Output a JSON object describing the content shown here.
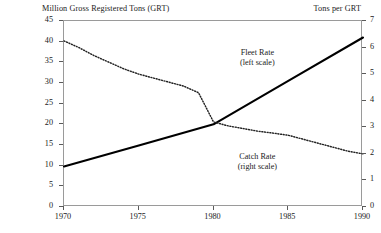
{
  "chart_data": {
    "type": "line",
    "title": "",
    "left_axis_title": "Million Gross Registered Tons (GRT)",
    "right_axis_title": "Tons per GRT",
    "xlabel": "",
    "x_ticks": [
      "1970",
      "1975",
      "1980",
      "1985",
      "1990"
    ],
    "x_tick_values": [
      1970,
      1975,
      1980,
      1985,
      1990
    ],
    "xlim": [
      1970,
      1990
    ],
    "left_ylabel": "Million Gross Registered Tons (GRT)",
    "left_ticks": [
      "0",
      "5",
      "10",
      "15",
      "20",
      "25",
      "30",
      "35",
      "40",
      "45"
    ],
    "left_tick_values": [
      0,
      5,
      10,
      15,
      20,
      25,
      30,
      35,
      40,
      45
    ],
    "ylim": [
      0,
      45
    ],
    "right_ylabel": "Tons per GRT",
    "right_ticks": [
      "0",
      "1",
      "2",
      "3",
      "4",
      "5",
      "6",
      "7"
    ],
    "right_tick_values": [
      0,
      1,
      2,
      3,
      4,
      5,
      6,
      7
    ],
    "right_ylim": [
      0,
      7
    ],
    "grid": false,
    "legend_position": "inline-annotations",
    "series": [
      {
        "name": "Fleet Rate",
        "axis": "left",
        "style": "solid",
        "color": "#000000",
        "annotation": [
          "Fleet Rate",
          "(left scale)"
        ],
        "x": [
          1970,
          1975,
          1980,
          1985,
          1990
        ],
        "values": [
          9.8,
          14.9,
          20.0,
          30.5,
          41.0
        ]
      },
      {
        "name": "Catch Rate",
        "axis": "right",
        "style": "dotted",
        "color": "#222222",
        "annotation": [
          "Catch Rate",
          "(right scale)"
        ],
        "x": [
          1970,
          1971,
          1972,
          1973,
          1974,
          1975,
          1976,
          1977,
          1978,
          1979,
          1980,
          1981,
          1982,
          1983,
          1984,
          1985,
          1986,
          1987,
          1988,
          1989,
          1990
        ],
        "values": [
          6.25,
          6.0,
          5.7,
          5.45,
          5.2,
          5.0,
          4.85,
          4.7,
          4.55,
          4.3,
          3.2,
          3.05,
          2.95,
          2.85,
          2.78,
          2.7,
          2.55,
          2.4,
          2.25,
          2.1,
          2.0
        ]
      }
    ],
    "annotations": [
      {
        "name": "fleet-rate-annotation",
        "lines": [
          "Fleet Rate",
          "(left scale)"
        ],
        "x": 1983.0,
        "y_px": 48
      },
      {
        "name": "catch-rate-annotation",
        "lines": [
          "Catch Rate",
          "(right scale)"
        ],
        "x": 1983.0,
        "y_px": 152
      }
    ]
  },
  "colors": {
    "background": "#ffffff",
    "frame": "#9a9a9a",
    "fleet_line": "#000000",
    "catch_line": "#222222",
    "text": "#1a1a1a"
  }
}
